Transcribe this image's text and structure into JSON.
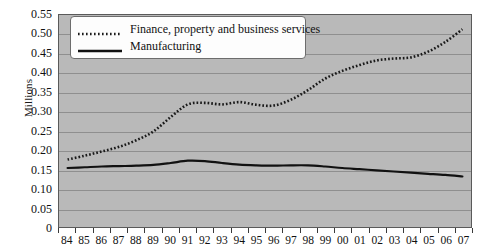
{
  "chart_data": {
    "type": "line",
    "title": "",
    "xlabel": "",
    "ylabel": "Millions",
    "ylim": [
      0,
      0.55
    ],
    "ytick_labels": [
      "0.55",
      "0.50",
      "0.45",
      "0.40",
      "0.35",
      "0.30",
      "0.25",
      "0.20",
      "0.15",
      "0.10",
      "0.05",
      "0"
    ],
    "ytick_values": [
      0.55,
      0.5,
      0.45,
      0.4,
      0.35,
      0.3,
      0.25,
      0.2,
      0.15,
      0.1,
      0.05,
      0
    ],
    "grid": true,
    "legend_position": "top-left",
    "categories": [
      "84",
      "85",
      "86",
      "87",
      "88",
      "89",
      "90",
      "91",
      "92",
      "93",
      "94",
      "95",
      "96",
      "97",
      "98",
      "99",
      "00",
      "01",
      "02",
      "03",
      "04",
      "05",
      "06",
      "07"
    ],
    "series": [
      {
        "name": "Finance, property and business services",
        "style": "dotted",
        "color": "#1a1a1a",
        "values": [
          0.175,
          0.185,
          0.196,
          0.208,
          0.225,
          0.248,
          0.285,
          0.318,
          0.322,
          0.318,
          0.324,
          0.317,
          0.315,
          0.33,
          0.355,
          0.385,
          0.405,
          0.42,
          0.432,
          0.437,
          0.44,
          0.455,
          0.48,
          0.513
        ]
      },
      {
        "name": "Manufacturing",
        "style": "solid",
        "color": "#111111",
        "values": [
          0.153,
          0.155,
          0.157,
          0.158,
          0.159,
          0.161,
          0.166,
          0.172,
          0.171,
          0.166,
          0.162,
          0.16,
          0.159,
          0.16,
          0.16,
          0.157,
          0.153,
          0.15,
          0.147,
          0.144,
          0.141,
          0.138,
          0.135,
          0.131
        ]
      }
    ]
  },
  "legend": {
    "items": [
      {
        "label": "Finance, property and business services",
        "key": "dotted-line-key"
      },
      {
        "label": "Manufacturing",
        "key": "solid-line-key"
      }
    ]
  },
  "colors": {
    "plot_background": "#b9b9b9",
    "gridline": "#8f8f8f",
    "axis": "#5a5a5a",
    "series_finance": "#1a1a1a",
    "series_manufacturing": "#111111",
    "legend_background": "#fdfdfd",
    "text": "#111111"
  }
}
